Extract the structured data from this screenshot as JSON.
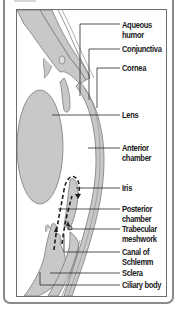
{
  "figure": {
    "title_cropped": true,
    "colors": {
      "tissue_fill": "#c8c8c8",
      "tissue_stroke": "#7a7a7a",
      "leader_line": "#2a2a2a",
      "frame": "#8a8a8a",
      "text": "#1a1a1a"
    },
    "labels": [
      {
        "id": "aqueous-humor",
        "line1": "Aqueous",
        "line2": "humor",
        "y": 20
      },
      {
        "id": "conjunctiva",
        "line1": "Conjunctiva",
        "line2": "",
        "y": 45
      },
      {
        "id": "cornea",
        "line1": "Cornea",
        "line2": "",
        "y": 63
      },
      {
        "id": "lens",
        "line1": "Lens",
        "line2": "",
        "y": 110
      },
      {
        "id": "anterior-chamber",
        "line1": "Anterior",
        "line2": "chamber",
        "y": 138
      },
      {
        "id": "iris",
        "line1": "Iris",
        "line2": "",
        "y": 183
      },
      {
        "id": "posterior-chamber",
        "line1": "Posterior",
        "line2": "chamber",
        "y": 201
      },
      {
        "id": "trabecular-meshwork",
        "line1": "Trabecular",
        "line2": "meshwork",
        "y": 223
      },
      {
        "id": "canal-of-schlemm",
        "line1": "Canal of",
        "line2": "Schlemm",
        "y": 246
      },
      {
        "id": "sclera",
        "line1": "Sclera",
        "line2": "",
        "y": 268
      },
      {
        "id": "ciliary-body",
        "line1": "Ciliary body",
        "line2": "",
        "y": 280
      }
    ]
  }
}
